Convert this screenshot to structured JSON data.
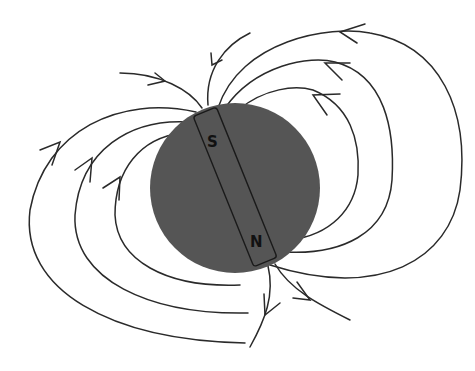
{
  "diagram": {
    "earth": {
      "color": "#555555"
    },
    "magnet": {
      "top_label": "S",
      "bottom_label": "N",
      "outline_color": "#1a1a1a"
    },
    "field_lines": {
      "color": "#2a2a2a",
      "direction": "arrows point from the N pole (bottom) around the outside toward the S pole (top)"
    }
  }
}
